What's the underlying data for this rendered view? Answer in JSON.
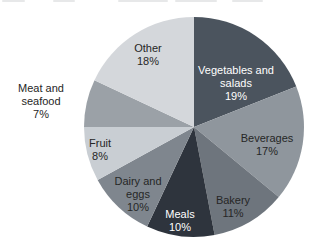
{
  "page": {
    "background": "#ffffff",
    "text_color": "#262626",
    "light_text_color": "#ffffff"
  },
  "chart_data": {
    "type": "pie",
    "title": "",
    "direction": "clockwise",
    "start_angle_deg": 0,
    "total": 100,
    "geometry": {
      "cx": 194,
      "cy": 127,
      "r": 110
    },
    "slices": [
      {
        "label": "Vegetables and salads",
        "value": 19,
        "pct_label": "19%",
        "color": "#4b545e",
        "text_color": "#ffffff",
        "label_lines": [
          "Vegetables and",
          "salads",
          "19%"
        ],
        "label_x": 236,
        "label_y": 83,
        "label_outside": false
      },
      {
        "label": "Beverages",
        "value": 17,
        "pct_label": "17%",
        "color": "#8f969d",
        "text_color": "#262626",
        "label_lines": [
          "Beverages",
          "17%"
        ],
        "label_x": 267,
        "label_y": 144,
        "label_outside": false
      },
      {
        "label": "Bakery",
        "value": 11,
        "pct_label": "11%",
        "color": "#6e757d",
        "text_color": "#262626",
        "label_lines": [
          "Bakery",
          "11%"
        ],
        "label_x": 233,
        "label_y": 206,
        "label_outside": false
      },
      {
        "label": "Meals",
        "value": 10,
        "pct_label": "10%",
        "color": "#2e343d",
        "text_color": "#ffffff",
        "label_lines": [
          "Meals",
          "10%"
        ],
        "label_x": 180,
        "label_y": 220,
        "label_outside": false
      },
      {
        "label": "Dairy and eggs",
        "value": 10,
        "pct_label": "10%",
        "color": "#7f868e",
        "text_color": "#262626",
        "label_lines": [
          "Dairy and",
          "eggs",
          "10%"
        ],
        "label_x": 138,
        "label_y": 194,
        "label_outside": false
      },
      {
        "label": "Fruit",
        "value": 8,
        "pct_label": "8%",
        "color": "#c9ced3",
        "text_color": "#262626",
        "label_lines": [
          "Fruit",
          "8%"
        ],
        "label_x": 100,
        "label_y": 149,
        "label_outside": false
      },
      {
        "label": "Meat and seafood",
        "value": 7,
        "pct_label": "7%",
        "color": "#9ba1a7",
        "text_color": "#262626",
        "label_lines": [
          "Meat and",
          "seafood",
          "7%"
        ],
        "label_x": 41,
        "label_y": 101,
        "label_outside": true
      },
      {
        "label": "Other",
        "value": 18,
        "pct_label": "18%",
        "color": "#d4d7db",
        "text_color": "#262626",
        "label_lines": [
          "Other",
          "18%"
        ],
        "label_x": 148,
        "label_y": 54,
        "label_outside": false
      }
    ]
  }
}
